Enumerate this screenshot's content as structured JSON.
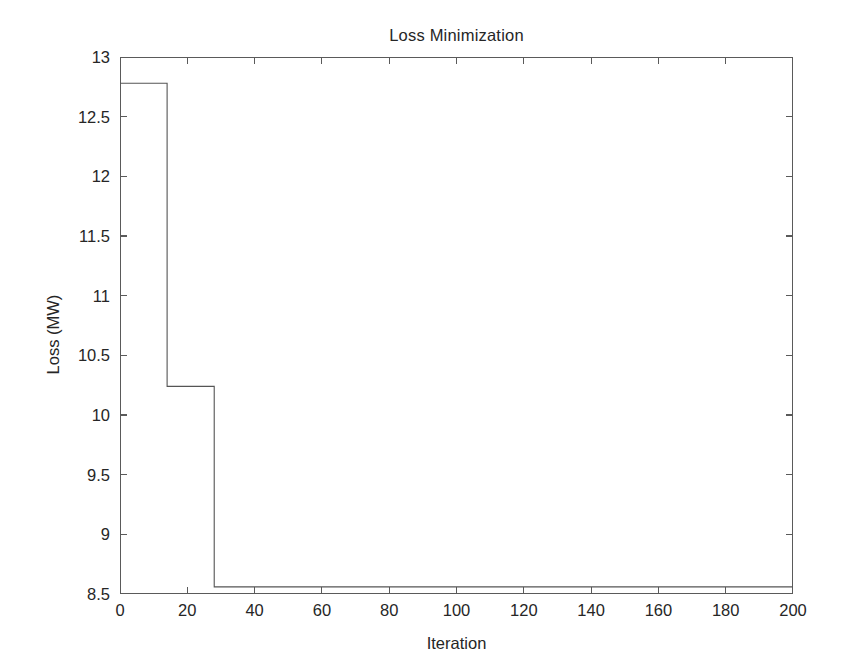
{
  "chart_data": {
    "type": "line",
    "title": "Loss Minimization",
    "xlabel": "Iteration",
    "ylabel": "Loss (MW)",
    "xlim": [
      0,
      200
    ],
    "ylim": [
      8.5,
      13
    ],
    "xticks": [
      0,
      20,
      40,
      60,
      80,
      100,
      120,
      140,
      160,
      180,
      200
    ],
    "xticklabels": [
      "0",
      "20",
      "40",
      "60",
      "80",
      "100",
      "120",
      "140",
      "160",
      "180",
      "200"
    ],
    "yticks": [
      8.5,
      9,
      9.5,
      10,
      10.5,
      11,
      11.5,
      12,
      12.5,
      13
    ],
    "yticklabels": [
      "8.5",
      "9",
      "9.5",
      "10",
      "10.5",
      "11",
      "11.5",
      "12",
      "12.5",
      "13"
    ],
    "grid": false,
    "legend": false,
    "line_color": "#555555",
    "line_width": 1.1,
    "series": [
      {
        "name": "Loss",
        "step": "post",
        "x": [
          0,
          14,
          14,
          28,
          28,
          200
        ],
        "y": [
          12.78,
          12.78,
          10.24,
          10.24,
          8.56,
          8.56
        ]
      }
    ],
    "annotations": [
      {
        "text": "initial loss plateau 12.78 MW from iteration 0 to 14"
      },
      {
        "text": "second plateau 10.24 MW from iteration 14 to 28"
      },
      {
        "text": "converged loss 8.56 MW from iteration 28 to 200"
      }
    ]
  },
  "figure": {
    "background_color": "#ffffff",
    "axis_color": "#5a5a5a",
    "text_color": "#262626"
  }
}
